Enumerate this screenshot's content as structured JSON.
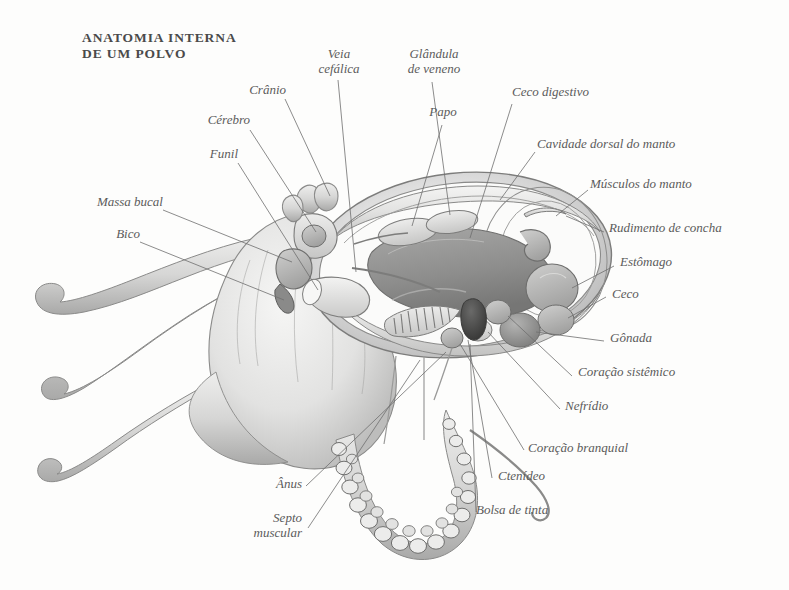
{
  "title": "Anatomia interna\nde um polvo",
  "figure": {
    "style": "grayscale-engraving",
    "background_color": "#fdfdfc",
    "ink_color": "#5b5b5b"
  },
  "labels": [
    {
      "id": "cranio",
      "text": "Crânio"
    },
    {
      "id": "cerebro",
      "text": "Cérebro"
    },
    {
      "id": "funil",
      "text": "Funil"
    },
    {
      "id": "massa-bucal",
      "text": "Massa bucal"
    },
    {
      "id": "bico",
      "text": "Bico"
    },
    {
      "id": "veia-cefalica",
      "text": "Veia\ncefálica"
    },
    {
      "id": "glandula-de-veneno",
      "text": "Glândula\nde veneno"
    },
    {
      "id": "papo",
      "text": "Papo"
    },
    {
      "id": "ceco-digestivo",
      "text": "Ceco digestivo"
    },
    {
      "id": "cavidade-dorsal",
      "text": "Cavidade dorsal do manto"
    },
    {
      "id": "musculos-do-manto",
      "text": "Músculos do manto"
    },
    {
      "id": "rudimento-concha",
      "text": "Rudimento de concha"
    },
    {
      "id": "estomago",
      "text": "Estômago"
    },
    {
      "id": "ceco",
      "text": "Ceco"
    },
    {
      "id": "gonada",
      "text": "Gônada"
    },
    {
      "id": "coracao-sistemico",
      "text": "Coração sistêmico"
    },
    {
      "id": "nefridio",
      "text": "Nefrídio"
    },
    {
      "id": "coracao-branquial",
      "text": "Coração branquial"
    },
    {
      "id": "ctenideo",
      "text": "Ctenídeo"
    },
    {
      "id": "bolsa-de-tinta",
      "text": "Bolsa de tinta"
    },
    {
      "id": "anus",
      "text": "Ânus"
    },
    {
      "id": "septo-muscular",
      "text": "Septo\nmuscular"
    }
  ]
}
